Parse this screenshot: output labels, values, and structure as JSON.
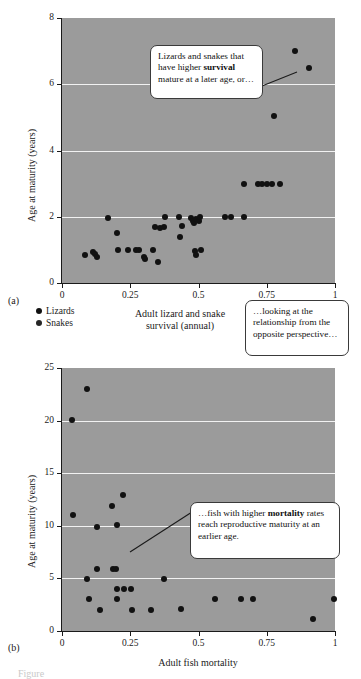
{
  "figure": {
    "bottom_caption": "Figure"
  },
  "panel_a": {
    "letter": "(a)",
    "ylabel": "Age at maturity (years)",
    "xlabel_line1": "Adult lizard and snake",
    "xlabel_line2": "survival (annual)",
    "yticks": [
      "0",
      "2",
      "4",
      "6",
      "8"
    ],
    "xticks": [
      "0",
      "0.25",
      "0.5",
      "0.75",
      "1"
    ]
  },
  "panel_b": {
    "letter": "(b)",
    "ylabel": "Age at maturity (years)",
    "xlabel": "Adult fish mortality",
    "yticks": [
      "0",
      "5",
      "10",
      "15",
      "20",
      "25"
    ],
    "xticks": [
      "0",
      "0.25",
      "0.5",
      "0.75",
      "1"
    ]
  },
  "legend": {
    "items": [
      {
        "label": "Lizards",
        "color": "#111111"
      },
      {
        "label": "Snakes",
        "color": "#262626"
      }
    ]
  },
  "callouts": [
    {
      "id": "callout-1",
      "text_before": "Lizards and snakes that have higher ",
      "bold": "survival",
      "text_after": " mature at a later age, or…"
    },
    {
      "id": "callout-2",
      "text_before": "…looking at the relationship from the opposite perspective…",
      "bold": "",
      "text_after": ""
    },
    {
      "id": "callout-3",
      "text_before": "…fish with higher ",
      "bold": "mortality",
      "text_after": " rates reach reproductive maturity at an earlier age."
    }
  ],
  "chart_data": [
    {
      "type": "scatter",
      "title": "",
      "panel": "(a)",
      "xlabel": "Adult lizard and snake survival (annual)",
      "ylabel": "Age at maturity (years)",
      "xlim": [
        0,
        1
      ],
      "ylim": [
        0,
        8
      ],
      "xticks": [
        0,
        0.25,
        0.5,
        0.75,
        1
      ],
      "yticks": [
        0,
        2,
        4,
        6,
        8
      ],
      "grid": "horizontal-gridlines-at-2-4-6",
      "legend": [
        "Lizards",
        "Snakes"
      ],
      "legend_position": "below-axes-left",
      "series": [
        {
          "name": "Lizards and snakes",
          "points": [
            [
              0.085,
              0.85
            ],
            [
              0.112,
              0.95
            ],
            [
              0.122,
              0.88
            ],
            [
              0.128,
              0.8
            ],
            [
              0.17,
              1.97
            ],
            [
              0.2,
              1.5
            ],
            [
              0.205,
              1.0
            ],
            [
              0.243,
              1.0
            ],
            [
              0.27,
              1.0
            ],
            [
              0.282,
              1.0
            ],
            [
              0.3,
              0.8
            ],
            [
              0.303,
              0.72
            ],
            [
              0.335,
              1.0
            ],
            [
              0.34,
              1.7
            ],
            [
              0.352,
              0.62
            ],
            [
              0.36,
              1.65
            ],
            [
              0.372,
              1.7
            ],
            [
              0.378,
              2.0
            ],
            [
              0.43,
              1.98
            ],
            [
              0.432,
              1.38
            ],
            [
              0.44,
              1.72
            ],
            [
              0.472,
              1.95
            ],
            [
              0.48,
              1.88
            ],
            [
              0.484,
              1.8
            ],
            [
              0.487,
              0.98
            ],
            [
              0.49,
              0.85
            ],
            [
              0.492,
              1.93
            ],
            [
              0.5,
              1.88
            ],
            [
              0.505,
              1.98
            ],
            [
              0.508,
              1.0
            ],
            [
              0.598,
              1.98
            ],
            [
              0.62,
              1.98
            ],
            [
              0.665,
              1.98
            ],
            [
              0.668,
              3.0
            ],
            [
              0.718,
              3.0
            ],
            [
              0.732,
              3.0
            ],
            [
              0.752,
              3.0
            ],
            [
              0.768,
              3.0
            ],
            [
              0.778,
              5.05
            ],
            [
              0.8,
              3.0
            ],
            [
              0.852,
              7.0
            ],
            [
              0.905,
              6.5
            ]
          ]
        }
      ]
    },
    {
      "type": "scatter",
      "title": "",
      "panel": "(b)",
      "xlabel": "Adult fish mortality",
      "ylabel": "Age at maturity (years)",
      "xlim": [
        0,
        1
      ],
      "ylim": [
        0,
        25
      ],
      "xticks": [
        0,
        0.25,
        0.5,
        0.75,
        1
      ],
      "yticks": [
        0,
        5,
        10,
        15,
        20,
        25
      ],
      "grid": "horizontal-gridlines-at-5-10-15-20",
      "series": [
        {
          "name": "Fish",
          "points": [
            [
              0.035,
              20.1
            ],
            [
              0.04,
              11.0
            ],
            [
              0.09,
              23.0
            ],
            [
              0.09,
              4.9
            ],
            [
              0.1,
              3.0
            ],
            [
              0.128,
              9.9
            ],
            [
              0.13,
              5.9
            ],
            [
              0.14,
              2.0
            ],
            [
              0.183,
              11.9
            ],
            [
              0.188,
              5.9
            ],
            [
              0.197,
              5.9
            ],
            [
              0.2,
              10.1
            ],
            [
              0.2,
              4.0
            ],
            [
              0.202,
              3.0
            ],
            [
              0.222,
              12.9
            ],
            [
              0.228,
              4.0
            ],
            [
              0.252,
              4.0
            ],
            [
              0.258,
              2.0
            ],
            [
              0.325,
              2.0
            ],
            [
              0.372,
              4.9
            ],
            [
              0.437,
              2.1
            ],
            [
              0.562,
              3.0
            ],
            [
              0.655,
              3.0
            ],
            [
              0.7,
              3.0
            ],
            [
              0.92,
              1.1
            ],
            [
              0.995,
              3.0
            ]
          ]
        }
      ]
    }
  ]
}
